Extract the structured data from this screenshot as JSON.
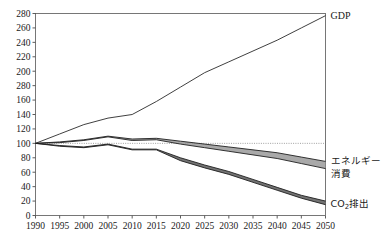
{
  "chart_data": {
    "type": "line",
    "title": "",
    "subtitle": "",
    "xlabel": "",
    "ylabel": "",
    "xlim": [
      1990,
      2050
    ],
    "ylim": [
      0,
      280
    ],
    "grid": false,
    "legend_position": "right-inline",
    "reference_line": {
      "value": 100,
      "style": "dotted"
    },
    "index_base": {
      "year": 1990,
      "value": 100
    },
    "x": [
      1990,
      1995,
      2000,
      2005,
      2010,
      2015,
      2020,
      2025,
      2030,
      2035,
      2040,
      2045,
      2050
    ],
    "ytick_labels": [
      "280",
      "260",
      "240",
      "220",
      "200",
      "280",
      "160",
      "140",
      "120",
      "100",
      "80",
      "60",
      "40",
      "20",
      "0"
    ],
    "ytick_values": [
      280,
      260,
      240,
      220,
      200,
      180,
      160,
      140,
      120,
      100,
      80,
      60,
      40,
      20,
      0
    ],
    "xtick_labels": [
      "1990",
      "1995",
      "2000",
      "2005",
      "2010",
      "2015",
      "2020",
      "2025",
      "2030",
      "2035",
      "2040",
      "2045",
      "2050"
    ],
    "series": [
      {
        "name": "GDP",
        "label": "GDP",
        "kind": "line",
        "color": "#2a2a2a",
        "values": [
          100,
          113,
          126,
          135,
          140,
          158,
          178,
          198,
          213,
          228,
          243,
          260,
          277
        ]
      },
      {
        "name": "energy-consumption",
        "label": "エネルギー",
        "label_line2": "消費",
        "kind": "band",
        "color": "#9a9a9a",
        "upper": [
          100,
          102,
          105,
          110,
          106,
          107,
          103,
          99,
          95,
          91,
          87,
          81,
          75
        ],
        "lower": [
          100,
          101,
          104,
          109,
          104,
          105,
          99,
          94,
          89,
          84,
          79,
          72,
          65
        ]
      },
      {
        "name": "co2-emissions",
        "label": "CO",
        "label_sub": "2",
        "label_tail": "排出",
        "kind": "band",
        "color": "#5a5a5a",
        "upper": [
          100,
          97,
          95,
          99,
          92,
          92,
          80,
          70,
          61,
          50,
          39,
          28,
          20
        ],
        "lower": [
          100,
          96,
          94,
          98,
          91,
          91,
          76,
          66,
          57,
          46,
          35,
          24,
          15
        ]
      }
    ]
  },
  "labels": {
    "gdp": "GDP",
    "energy_line1": "エネルギー",
    "energy_line2": "消費",
    "co2_main": "CO",
    "co2_sub": "2",
    "co2_tail": "排出"
  }
}
